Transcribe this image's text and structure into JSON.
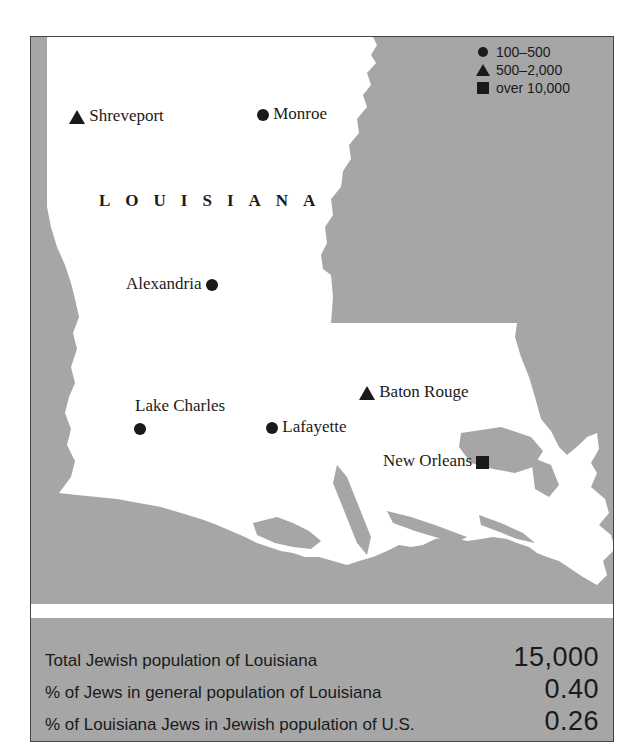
{
  "map": {
    "state_name": "LOUISIANA",
    "legend": [
      {
        "symbol": "circle",
        "label": "100–500"
      },
      {
        "symbol": "triangle",
        "label": "500–2,000"
      },
      {
        "symbol": "square",
        "label": "over 10,000"
      }
    ],
    "cities": [
      {
        "name": "Shreveport",
        "symbol": "triangle"
      },
      {
        "name": "Monroe",
        "symbol": "circle"
      },
      {
        "name": "Alexandria",
        "symbol": "circle"
      },
      {
        "name": "Lake Charles",
        "symbol": "circle"
      },
      {
        "name": "Lafayette",
        "symbol": "circle"
      },
      {
        "name": "Baton Rouge",
        "symbol": "triangle"
      },
      {
        "name": "New Orleans",
        "symbol": "square"
      }
    ],
    "colors": {
      "land": "#ffffff",
      "background": "#a6a6a6",
      "marker": "#1a1a1a"
    }
  },
  "stats": [
    {
      "label": "Total Jewish population of Louisiana",
      "value": "15,000"
    },
    {
      "label": "% of Jews in general population of Louisiana",
      "value": "0.40"
    },
    {
      "label": "% of Louisiana Jews in Jewish population of U.S.",
      "value": "0.26"
    }
  ]
}
